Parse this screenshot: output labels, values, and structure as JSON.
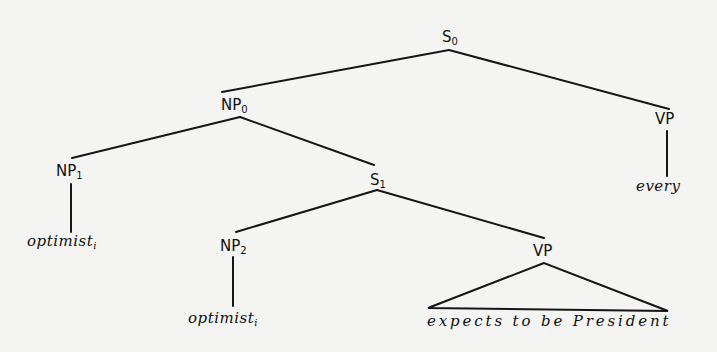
{
  "diagram": {
    "type": "syntax-tree",
    "nodes": {
      "s0": {
        "label": "S",
        "subscript": "0"
      },
      "np0": {
        "label": "NP",
        "subscript": "0"
      },
      "vp_top": {
        "label": "VP",
        "subscript": ""
      },
      "np1": {
        "label": "NP",
        "subscript": "1"
      },
      "s1": {
        "label": "S",
        "subscript": "1"
      },
      "np2": {
        "label": "NP",
        "subscript": "2"
      },
      "vp_low": {
        "label": "VP",
        "subscript": ""
      }
    },
    "leaves": {
      "every": {
        "text": "every"
      },
      "optimist1": {
        "text": "optimist",
        "subscript": "i"
      },
      "optimist2": {
        "text": "optimist",
        "subscript": "i"
      },
      "vp_phrase": {
        "text": "expects to be President"
      }
    },
    "edges": [
      [
        "S0",
        "NP0"
      ],
      [
        "S0",
        "VP"
      ],
      [
        "NP0",
        "NP1"
      ],
      [
        "NP0",
        "S1"
      ],
      [
        "NP1",
        "optimist_i"
      ],
      [
        "S1",
        "NP2"
      ],
      [
        "S1",
        "VP"
      ],
      [
        "NP2",
        "optimist_i"
      ],
      [
        "VP",
        "every"
      ],
      [
        "VP",
        "expects to be President (triangle)"
      ]
    ]
  }
}
